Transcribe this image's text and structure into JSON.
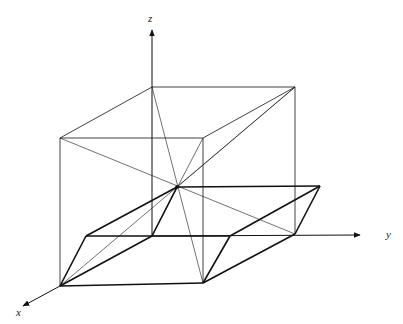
{
  "labels": {
    "x": "x",
    "y": "y",
    "z": "z"
  },
  "colors": {
    "line": "#111111",
    "background": "#ffffff"
  },
  "points": {
    "O": [
      152,
      236
    ],
    "Bz": [
      152,
      87
    ],
    "Tbr": [
      295,
      87
    ],
    "Tfl": [
      60,
      138
    ],
    "Tfr": [
      203,
      138
    ],
    "Bfl": [
      60,
      286
    ],
    "Bfr": [
      203,
      283
    ],
    "Bbr": [
      295,
      234
    ],
    "C": [
      177,
      187
    ],
    "P1": [
      86,
      236
    ],
    "P2": [
      320,
      186
    ],
    "P3": [
      230,
      236
    ]
  }
}
